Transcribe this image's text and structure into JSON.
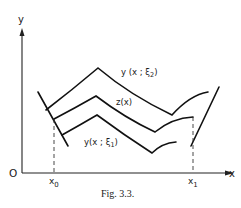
{
  "figure": {
    "caption": "Fig. 3.3.",
    "axes": {
      "x_label": "x",
      "y_label": "y",
      "origin_label": "O",
      "x0_label": "x",
      "x0_sub": "0",
      "x1_label": "x",
      "x1_sub": "1"
    },
    "curves": [
      {
        "id": "y_xi2",
        "label_main": "y (x ; ξ",
        "label_sub": "2",
        "label_end": ")"
      },
      {
        "id": "z",
        "label_main": "z(x)"
      },
      {
        "id": "y_xi1",
        "label_main": "y(x ; ξ",
        "label_sub": "1",
        "label_end": ")"
      }
    ],
    "colors": {
      "ink": "#111111",
      "background": "#ffffff"
    }
  }
}
